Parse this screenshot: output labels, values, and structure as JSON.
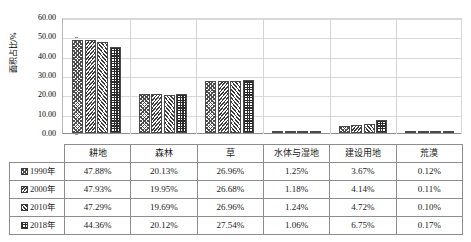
{
  "chart_data": {
    "type": "bar",
    "title": "",
    "xlabel": "",
    "ylabel": "面积占比/%",
    "ylim": [
      0,
      60
    ],
    "ytick_labels": [
      "0.00",
      "10.00",
      "20.00",
      "30.00",
      "40.00",
      "50.00",
      "60.00"
    ],
    "ytick_values": [
      0,
      10,
      20,
      30,
      40,
      50,
      60
    ],
    "grid": true,
    "legend_position": "data-table",
    "categories": [
      "耕地",
      "森林",
      "草",
      "水体与湿地",
      "建设用地",
      "荒漠"
    ],
    "series": [
      {
        "name": "1990年",
        "values": [
          47.88,
          20.13,
          26.96,
          1.25,
          3.67,
          0.12
        ],
        "labels": [
          "47.88%",
          "20.13%",
          "26.96%",
          "1.25%",
          "3.67%",
          "0.12%"
        ]
      },
      {
        "name": "2000年",
        "values": [
          47.93,
          19.95,
          26.68,
          1.18,
          4.14,
          0.11
        ],
        "labels": [
          "47.93%",
          "19.95%",
          "26.68%",
          "1.18%",
          "4.14%",
          "0.11%"
        ]
      },
      {
        "name": "2010年",
        "values": [
          47.29,
          19.69,
          26.96,
          1.24,
          4.72,
          0.1
        ],
        "labels": [
          "47.29%",
          "19.69%",
          "26.96%",
          "1.24%",
          "4.72%",
          "0.10%"
        ]
      },
      {
        "name": "2018年",
        "values": [
          44.36,
          20.12,
          27.54,
          1.06,
          6.75,
          0.17
        ],
        "labels": [
          "44.36%",
          "20.12%",
          "27.54%",
          "1.06%",
          "6.75%",
          "0.17%"
        ]
      }
    ]
  },
  "colors": {
    "axis": "#8f8f8f",
    "grid": "#d9d9d9",
    "bar_outline": "#4a4a4a",
    "table_border": "#8d8d8d",
    "text": "#000000"
  }
}
